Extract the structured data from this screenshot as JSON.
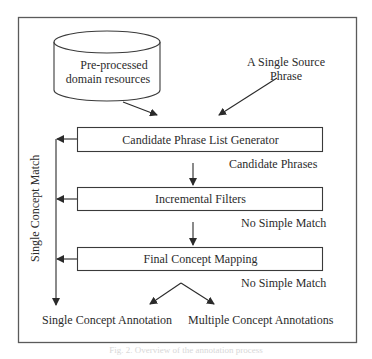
{
  "diagram": {
    "data_source": {
      "label_line1": "Pre-processed",
      "label_line2": "domain resources",
      "shape": "cylinder"
    },
    "input": {
      "label_line1": "A Single Source",
      "label_line2": "Phrase"
    },
    "steps": [
      {
        "label": "Candidate Phrase List Generator",
        "output_label": "Candidate Phrases"
      },
      {
        "label": "Incremental Filters",
        "output_label": "No Simple Match"
      },
      {
        "label": "Final Concept Mapping",
        "output_label": "No Simple Match"
      }
    ],
    "side_branch_label": "Single Concept Match",
    "outputs": {
      "single": "Single Concept Annotation",
      "multiple": "Multiple Concept Annotations"
    },
    "caption": "Fig. 2. Overview of the annotation process"
  },
  "colors": {
    "line": "#3a3a3a",
    "text": "#2b2b2b",
    "frame": "#555555",
    "background": "#ffffff"
  }
}
